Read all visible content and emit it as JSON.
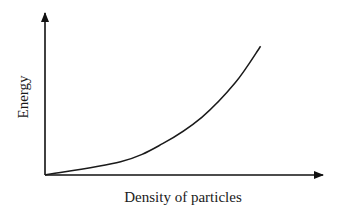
{
  "chart_data": {
    "type": "line",
    "title": "",
    "xlabel": "Density of particles",
    "ylabel": "Energy",
    "grid": false,
    "legend": null,
    "ticks": false,
    "series": [
      {
        "name": "Energy vs density",
        "x": [
          0,
          0.27,
          0.42,
          0.56,
          0.68,
          0.77
        ],
        "y": [
          0,
          0.08,
          0.19,
          0.35,
          0.56,
          0.78
        ]
      }
    ],
    "xlim": [
      0,
      1
    ],
    "ylim": [
      0,
      1
    ]
  },
  "colors": {
    "axis": "#111111",
    "curve": "#1a1a1a",
    "background": "#ffffff"
  }
}
